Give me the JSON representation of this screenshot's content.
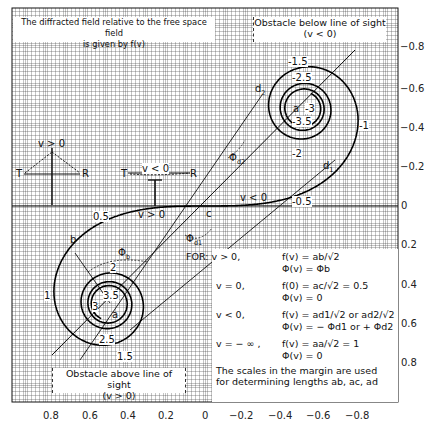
{
  "title_box": {
    "line1": "The diffracted field relative to the free space field",
    "line2": "is given by f(v)"
  },
  "top_right_box": {
    "line1": "Obstacle below line of sight",
    "line2": "(v < 0)"
  },
  "bottom_left_box": {
    "line1": "Obstacle above line of sight",
    "line2": "(v > 0)"
  },
  "insets": {
    "positive": {
      "label": "v > 0",
      "t": "T",
      "r": "R"
    },
    "negative": {
      "label": "v < 0",
      "t": "T",
      "r": "R"
    }
  },
  "curve_labels": {
    "upper": [
      "-1.5",
      "-2.5",
      "-3",
      "-3.5",
      "-2",
      "-1",
      "-0.5"
    ],
    "lower": [
      "0.5",
      "1",
      "1.5",
      "2",
      "2.5",
      "3",
      "3.5"
    ],
    "points": {
      "a_upper": "a",
      "a_lower": "a",
      "b": "b",
      "c": "c",
      "d1": "d",
      "d2": "d"
    },
    "arrows": {
      "v_neg": "v < 0",
      "v_pos": "v > 0"
    },
    "angles": {
      "phi_b": "Φ",
      "phi_d1": "Φ",
      "phi_d2": "Φ"
    }
  },
  "formula_box": {
    "for_label": "FOR:",
    "rows": [
      {
        "cond": "v > 0,",
        "f": "f(v) = ab/√2",
        "phi": "Φ(v) = Φb"
      },
      {
        "cond": "v = 0,",
        "f": "f(0) = ac/√2 = 0.5",
        "phi": "Φ(v) = 0"
      },
      {
        "cond": "v < 0,",
        "f": "f(v) = ad1/√2 or ad2/√2",
        "phi": "Φ(v) = − Φd1  or + Φd2"
      },
      {
        "cond": "v = − ∞ ,",
        "f": "f(v) = aa/√2 = 1",
        "phi": "Φ(v) = 0"
      }
    ],
    "note_line1": "The scales in the margin are used",
    "note_line2": "for determining lengths ab, ac, ad"
  },
  "chart_data": {
    "type": "line",
    "xlabel": "",
    "ylabel": "",
    "bottom_axis_ticks": [
      "0.8",
      "0.6",
      "0.4",
      "0.2",
      "0",
      "−0.2",
      "−0.4",
      "−0.6",
      "−0.8"
    ],
    "right_axis_ticks": [
      "−0.8",
      "−0.6",
      "−0.4",
      "−0.2",
      "0",
      "0.2",
      "0.4",
      "0.6",
      "0.8"
    ],
    "xlim": [
      0.8,
      -0.8
    ],
    "ylim": [
      -0.8,
      0.8
    ],
    "grid": true,
    "spiral": {
      "origin_px": [
        206,
        206
      ],
      "scale_px": 195,
      "v_range": [
        -3.7,
        3.7
      ],
      "labeled_v": [
        -3.5,
        -3,
        -2.5,
        -2,
        -1.5,
        -1,
        -0.5,
        0,
        0.5,
        1,
        1.5,
        2,
        2.5,
        3,
        3.5
      ],
      "centers": {
        "v_minus_inf": [
          -0.5,
          -0.5
        ],
        "v_plus_inf": [
          0.5,
          0.5
        ]
      }
    }
  }
}
